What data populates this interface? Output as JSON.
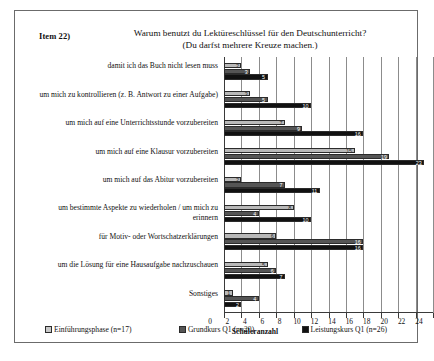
{
  "item_label": "Item 22)",
  "title": {
    "line1": "Warum benutzt du Lektüreschlüssel für den Deutschunterricht?",
    "line2": "(Du darfst mehrere Kreuze machen.)"
  },
  "chart_data": {
    "type": "bar",
    "orientation": "horizontal",
    "title": "Warum benutzt du Lektüreschlüssel für den Deutschunterricht? (Du darfst mehrere Kreuze machen.)",
    "xlabel": "Schüleranzahl",
    "ylabel": "",
    "xlim": [
      0,
      24
    ],
    "xticks": [
      0,
      2,
      4,
      6,
      8,
      10,
      12,
      14,
      16,
      18,
      20,
      22,
      24
    ],
    "grid": true,
    "legend_position": "bottom",
    "categories": [
      "damit ich das Buch nicht lesen muss",
      "um mich zu kontrollieren (z. B. Antwort zu einer Aufgabe)",
      "um mich auf eine Unterrichtsstunde vorzubereiten",
      "um mich auf eine Klausur vorzubereiten",
      "um mich auf das Abitur vorzubereiten",
      "um bestimmte Aspekte zu wiederholen / um mich zu erinnern",
      "für Motiv- oder Wortschatzerklärungen",
      "um die Lösung für eine Hausaufgabe nachzuschauen",
      "Sonstiges"
    ],
    "series": [
      {
        "name": "Einführungsphase (n=17)",
        "color": "#b9b9b9",
        "values": [
          2,
          3,
          7,
          15,
          2,
          8,
          6,
          5,
          1
        ]
      },
      {
        "name": "Grundkurs Q1 (n=20)",
        "color": "#555555",
        "values": [
          3,
          5,
          9,
          19,
          7,
          4,
          16,
          6,
          4
        ]
      },
      {
        "name": "Leistungskurs Q1 (n=26)",
        "color": "#111111",
        "values": [
          5,
          10,
          16,
          23,
          11,
          10,
          16,
          7,
          2
        ]
      }
    ]
  },
  "legend": [
    {
      "label": "Einführungsphase (n=17)"
    },
    {
      "label": "Grundkurs Q1 (n=20)"
    },
    {
      "label": "Leistungskurs Q1 (n=26)"
    }
  ]
}
